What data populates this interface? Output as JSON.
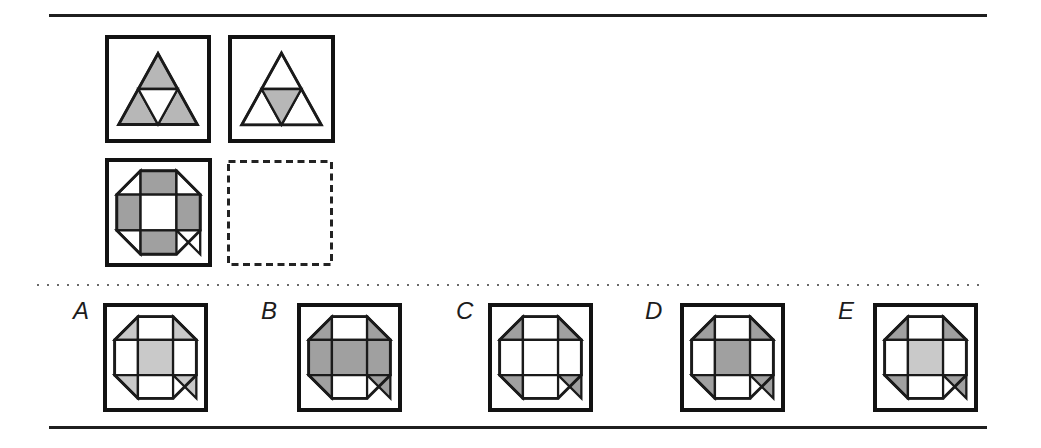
{
  "colors": {
    "white": "#ffffff",
    "light_gray": "#c9c9c9",
    "mid_gray": "#b7b7b7",
    "dark_gray": "#a0a0a0",
    "line": "#1a1a1a"
  },
  "problem": {
    "pair_top": [
      {
        "type": "triangle4",
        "name": "triangle-outer-shaded",
        "fills": {
          "top": "mid_gray",
          "bottom_left": "mid_gray",
          "bottom_right": "mid_gray",
          "middle": "white"
        }
      },
      {
        "type": "triangle4",
        "name": "triangle-middle-shaded",
        "fills": {
          "top": "white",
          "bottom_left": "white",
          "bottom_right": "white",
          "middle": "mid_gray"
        }
      }
    ],
    "pair_bottom": [
      {
        "type": "octagon9",
        "name": "octagon-edge-squares-shaded",
        "fills": {
          "corner_tl": "white",
          "top": "dark_gray",
          "corner_tr": "white",
          "left": "dark_gray",
          "center": "white",
          "right": "dark_gray",
          "corner_bl": "white",
          "bottom": "dark_gray",
          "corner_br": "white"
        }
      },
      {
        "type": "empty",
        "name": "missing-figure-placeholder"
      }
    ]
  },
  "options": [
    {
      "label": "A",
      "figure": {
        "type": "octagon9",
        "fills": {
          "corner_tl": "light_gray",
          "top": "white",
          "corner_tr": "light_gray",
          "left": "white",
          "center": "light_gray",
          "right": "white",
          "corner_bl": "light_gray",
          "bottom": "white",
          "corner_br": "light_gray"
        }
      }
    },
    {
      "label": "B",
      "figure": {
        "type": "octagon9",
        "fills": {
          "corner_tl": "dark_gray",
          "top": "white",
          "corner_tr": "dark_gray",
          "left": "dark_gray",
          "center": "dark_gray",
          "right": "dark_gray",
          "corner_bl": "dark_gray",
          "bottom": "white",
          "corner_br": "dark_gray"
        }
      }
    },
    {
      "label": "C",
      "figure": {
        "type": "octagon9",
        "fills": {
          "corner_tl": "dark_gray",
          "top": "white",
          "corner_tr": "dark_gray",
          "left": "white",
          "center": "white",
          "right": "white",
          "corner_bl": "dark_gray",
          "bottom": "white",
          "corner_br": "dark_gray"
        }
      }
    },
    {
      "label": "D",
      "figure": {
        "type": "octagon9",
        "fills": {
          "corner_tl": "dark_gray",
          "top": "white",
          "corner_tr": "dark_gray",
          "left": "white",
          "center": "dark_gray",
          "right": "white",
          "corner_bl": "dark_gray",
          "bottom": "white",
          "corner_br": "dark_gray"
        }
      }
    },
    {
      "label": "E",
      "figure": {
        "type": "octagon9",
        "fills": {
          "corner_tl": "dark_gray",
          "top": "white",
          "corner_tr": "dark_gray",
          "left": "white",
          "center": "light_gray",
          "right": "white",
          "corner_bl": "dark_gray",
          "bottom": "white",
          "corner_br": "dark_gray"
        }
      }
    }
  ]
}
